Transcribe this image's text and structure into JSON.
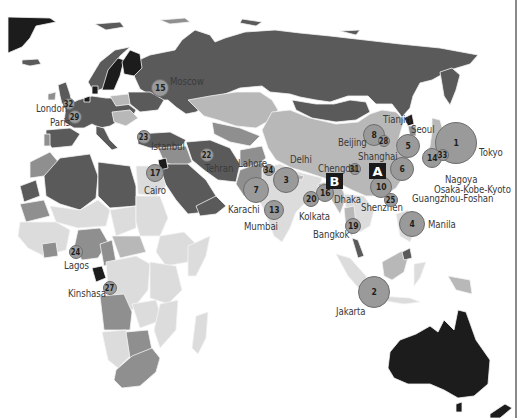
{
  "map": {
    "title": "",
    "colors": {
      "ocean": "#ffffff",
      "darkest": "#1c1c1c",
      "dark": "#5a5a5a",
      "medium": "#8f8f8f",
      "light": "#b8b8b8",
      "lightest": "#dcdcdc",
      "bubble_fill": "#9a9a9a",
      "bubble_stroke": "#6d6d6d",
      "marker_fill": "#1a1a1a"
    },
    "markers": [
      {
        "label": "A",
        "x": 377,
        "y": 171
      },
      {
        "label": "B",
        "x": 334,
        "y": 181
      }
    ],
    "cities": [
      {
        "rank": "1",
        "name": "Tokyo",
        "x": 456,
        "y": 143,
        "r": 21,
        "lx": 479,
        "ly": 146
      },
      {
        "rank": "2",
        "name": "Jakarta",
        "x": 374,
        "y": 292,
        "r": 16,
        "lx": 336,
        "ly": 305
      },
      {
        "rank": "3",
        "name": "Delhi",
        "x": 286,
        "y": 180,
        "r": 13,
        "lx": 290,
        "ly": 153
      },
      {
        "rank": "4",
        "name": "Manila",
        "x": 412,
        "y": 224,
        "r": 13,
        "lx": 428,
        "ly": 218
      },
      {
        "rank": "5",
        "name": "",
        "x": 408,
        "y": 146,
        "r": 12
      },
      {
        "rank": "6",
        "name": "",
        "x": 402,
        "y": 169,
        "r": 12
      },
      {
        "rank": "7",
        "name": "Karachi",
        "x": 256,
        "y": 190,
        "r": 13,
        "lx": 228,
        "ly": 203
      },
      {
        "rank": "8",
        "name": "Beijing",
        "x": 374,
        "y": 135,
        "r": 11,
        "lx": 338,
        "ly": 136
      },
      {
        "rank": "10",
        "name": "Shenzhen",
        "x": 381,
        "y": 187,
        "r": 11,
        "lx": 361,
        "ly": 201
      },
      {
        "rank": "13",
        "name": "Mumbai",
        "x": 274,
        "y": 210,
        "r": 10,
        "lx": 244,
        "ly": 220
      },
      {
        "rank": "14",
        "name": "",
        "x": 432,
        "y": 158,
        "r": 10
      },
      {
        "rank": "15",
        "name": "Moscow",
        "x": 160,
        "y": 88,
        "r": 9,
        "lx": 170,
        "ly": 75
      },
      {
        "rank": "16",
        "name": "",
        "x": 325,
        "y": 193,
        "r": 9
      },
      {
        "rank": "17",
        "name": "Cairo",
        "x": 155,
        "y": 173,
        "r": 9,
        "lx": 144,
        "ly": 184
      },
      {
        "rank": "19",
        "name": "Bangkok",
        "x": 353,
        "y": 226,
        "r": 8,
        "lx": 313,
        "ly": 228
      },
      {
        "rank": "20",
        "name": "Kolkata",
        "x": 311,
        "y": 199,
        "r": 8,
        "lx": 299,
        "ly": 210
      },
      {
        "rank": "22",
        "name": "Tehran",
        "x": 207,
        "y": 155,
        "r": 7,
        "lx": 205,
        "ly": 162
      },
      {
        "rank": "23",
        "name": "Istanbul",
        "x": 144,
        "y": 137,
        "r": 7,
        "lx": 151,
        "ly": 140
      },
      {
        "rank": "24",
        "name": "Lagos",
        "x": 76,
        "y": 252,
        "r": 7,
        "lx": 64,
        "ly": 259
      },
      {
        "rank": "25",
        "name": "Guangzhou-Foshan",
        "x": 391,
        "y": 200,
        "r": 7,
        "lx": 412,
        "ly": 192
      },
      {
        "rank": "27",
        "name": "Kinshasa",
        "x": 110,
        "y": 288,
        "r": 7,
        "lx": 68,
        "ly": 287
      },
      {
        "rank": "28",
        "name": "Tianjin",
        "x": 384,
        "y": 141,
        "r": 6,
        "lx": 383,
        "ly": 113
      },
      {
        "rank": "29",
        "name": "Paris",
        "x": 75,
        "y": 117,
        "r": 7,
        "lx": 50,
        "ly": 116
      },
      {
        "rank": "31",
        "name": "Chengdu",
        "x": 355,
        "y": 169,
        "r": 6,
        "lx": 318,
        "ly": 162
      },
      {
        "rank": "32",
        "name": "London",
        "x": 69,
        "y": 104,
        "r": 6,
        "lx": 36,
        "ly": 102
      },
      {
        "rank": "33",
        "name": "Nagoya",
        "x": 443,
        "y": 155,
        "r": 6,
        "lx": 445,
        "ly": 173
      },
      {
        "rank": "34",
        "name": "Lahore",
        "x": 269,
        "y": 170,
        "r": 6,
        "lx": 238,
        "ly": 157
      }
    ],
    "extra_labels": [
      {
        "name": "Seoul",
        "x": 411,
        "y": 123
      },
      {
        "name": "Shanghai",
        "x": 358,
        "y": 150
      },
      {
        "name": "Osaka-Kobe-Kyoto",
        "x": 434,
        "y": 183
      },
      {
        "name": "Dhaka",
        "x": 334,
        "y": 193
      }
    ]
  }
}
